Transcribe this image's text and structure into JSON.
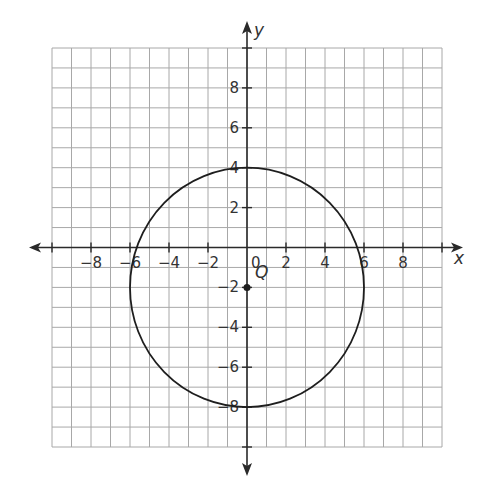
{
  "chart_data": {
    "type": "scatter",
    "title": "",
    "xlabel": "x",
    "ylabel": "y",
    "xlim": [
      -10,
      10
    ],
    "ylim": [
      -10,
      10
    ],
    "grid": true,
    "grid_step": 1,
    "x_tick_labels": [
      "-8",
      "-6",
      "-4",
      "-2",
      "0",
      "2",
      "4",
      "6",
      "8"
    ],
    "y_tick_labels": [
      "8",
      "6",
      "4",
      "2",
      "-2",
      "-4",
      "-6",
      "-8"
    ],
    "x_ticks": [
      -8,
      -6,
      -4,
      -2,
      2,
      4,
      6,
      8
    ],
    "y_ticks": [
      8,
      6,
      4,
      2,
      -2,
      -4,
      -6,
      -8
    ],
    "origin_label": "0",
    "shapes": [
      {
        "type": "circle",
        "center": [
          0,
          -2
        ],
        "radius": 6,
        "name": "circle"
      }
    ],
    "points": [
      {
        "label": "Q",
        "x": 0,
        "y": -2
      }
    ]
  },
  "labels": {
    "x_axis": "x",
    "y_axis": "y",
    "origin": "0",
    "point_q": "Q"
  },
  "colors": {
    "grid": "#a8a8a8",
    "axis": "#2a2a2a",
    "curve": "#1e1e1e",
    "text": "#333333"
  }
}
